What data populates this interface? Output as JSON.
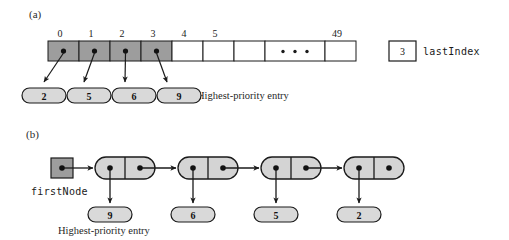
{
  "figure": {
    "type": "data-structure-diagram",
    "panels": [
      {
        "id": "a",
        "label": "(a)",
        "representation": "array",
        "caption": "Highest-priority entry",
        "array": {
          "total_slots": 50,
          "index_labels": [
            "0",
            "1",
            "2",
            "3",
            "4",
            "5",
            "49"
          ],
          "ellipsis": "• • •",
          "occupied_cells": [
            {
              "index": "0",
              "entry": "2",
              "shaded": true
            },
            {
              "index": "1",
              "entry": "5",
              "shaded": true
            },
            {
              "index": "2",
              "entry": "6",
              "shaded": true
            },
            {
              "index": "3",
              "entry": "9",
              "shaded": true
            }
          ],
          "empty_cells": [
            "4",
            "5",
            "",
            "49"
          ]
        },
        "variable": {
          "name": "lastIndex",
          "value": "3"
        },
        "entries": [
          "2",
          "5",
          "6",
          "9"
        ]
      },
      {
        "id": "b",
        "label": "(b)",
        "representation": "linked-list",
        "caption": "Highest-priority entry",
        "head_pointer": {
          "name": "firstNode"
        },
        "nodes": [
          {
            "entry": "9",
            "has_next": true
          },
          {
            "entry": "6",
            "has_next": true
          },
          {
            "entry": "5",
            "has_next": true
          },
          {
            "entry": "2",
            "has_next": false
          }
        ]
      }
    ]
  },
  "colors": {
    "shaded_cell": "#9d9d9d",
    "node_fill": "#d4d4d4",
    "oval_fill": "#d9d9d9",
    "stroke": "#1a1a1a",
    "background": "#ffffff"
  }
}
